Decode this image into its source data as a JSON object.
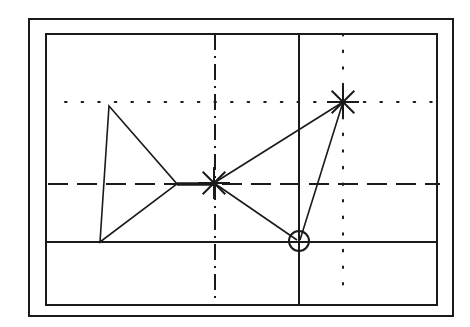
{
  "diagram": {
    "width": 470,
    "height": 327,
    "stroke_color": "#1a1a1a",
    "background": "#ffffff",
    "frames": {
      "outer": {
        "x1": 29,
        "y1": 19,
        "x2": 453,
        "y2": 316
      },
      "inner": {
        "x1": 46,
        "y1": 34,
        "x2": 437,
        "y2": 305
      }
    },
    "guide_lines": [
      {
        "name": "dotted-horizontal",
        "style": "dotted",
        "x1": 65,
        "y1": 102,
        "x2": 437,
        "y2": 102
      },
      {
        "name": "dashed-horizontal",
        "style": "dashed",
        "x1": 48,
        "y1": 184,
        "x2": 440,
        "y2": 184
      },
      {
        "name": "solid-horizontal",
        "style": "solid",
        "x1": 46,
        "y1": 242,
        "x2": 437,
        "y2": 242
      },
      {
        "name": "dashdot-vertical",
        "style": "dashdot",
        "x1": 215,
        "y1": 34,
        "x2": 215,
        "y2": 305
      },
      {
        "name": "solid-vertical",
        "style": "solid",
        "x1": 299,
        "y1": 34,
        "x2": 299,
        "y2": 305
      },
      {
        "name": "dotted-vertical",
        "style": "dotted",
        "x1": 343,
        "y1": 34,
        "x2": 343,
        "y2": 288
      }
    ],
    "triangle": {
      "points": [
        [
          109,
          106
        ],
        [
          177,
          184
        ],
        [
          100,
          242
        ]
      ]
    },
    "connectors": [
      {
        "from": [
          214,
          183
        ],
        "to": [
          343,
          102
        ]
      },
      {
        "from": [
          214,
          183
        ],
        "to": [
          297,
          240
        ]
      },
      {
        "from": [
          343,
          102
        ],
        "to": [
          300,
          240
        ]
      },
      {
        "from": [
          177,
          184
        ],
        "to": [
          214,
          184
        ]
      }
    ],
    "star_markers": [
      {
        "name": "star-marker-center",
        "cx": 214,
        "cy": 183,
        "r": 16
      },
      {
        "name": "star-marker-upper-right",
        "cx": 343,
        "cy": 102,
        "r": 16
      }
    ],
    "circle_marker": {
      "cx": 299,
      "cy": 241,
      "r": 10
    }
  }
}
